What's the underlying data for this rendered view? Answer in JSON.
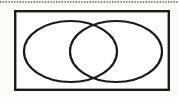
{
  "figure": {
    "kind": "venn-diagram",
    "caption": "",
    "background_color": "#fbfbfa",
    "stroke_color": "#1a1a1a",
    "fill_color": "#ffffff"
  },
  "top_rule": {
    "style": "dotted",
    "color": "#5a5a5a",
    "y": 2,
    "x_start": 0,
    "x_end": 178,
    "thickness": 1.6,
    "dash_pattern": "1.4 1.4"
  },
  "universal_set_box": {
    "label": "",
    "x": 14,
    "y": 10,
    "width": 156,
    "height": 81,
    "stroke_width": 2.4,
    "fill": "#ffffff"
  },
  "sets": [
    {
      "name": "left-set",
      "label": "",
      "cx": 70.5,
      "cy": 51.5,
      "rx": 46.5,
      "ry": 30.5,
      "stroke_width": 2.2,
      "fill": "none"
    },
    {
      "name": "right-set",
      "label": "",
      "cx": 116,
      "cy": 51.5,
      "rx": 46,
      "ry": 30.5,
      "stroke_width": 2.2,
      "fill": "none"
    }
  ],
  "intersection": {
    "name": "intersection-region",
    "label": "",
    "upper_crossing": {
      "x": 95,
      "y": 25
    },
    "lower_crossing": {
      "x": 95,
      "y": 78
    }
  }
}
